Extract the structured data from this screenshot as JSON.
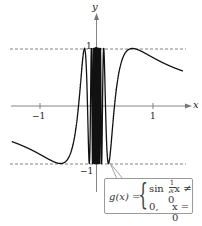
{
  "chart_data": {
    "type": "line",
    "title": "",
    "function_label": "g(x)",
    "definition": {
      "case1_expr": "sin 1/x",
      "case1_condition": "x ≠ 0",
      "case2_expr": "0,",
      "case2_condition": "x = 0"
    },
    "xlabel": "x",
    "ylabel": "y",
    "xlim": [
      -1.5,
      1.53
    ],
    "ylim": [
      -1,
      1
    ],
    "x_ticks": [
      -1,
      1
    ],
    "x_tick_labels": [
      "−1",
      "1"
    ],
    "y_tick_labels": [
      "1",
      "−1"
    ],
    "asymptote_lines": [
      {
        "y": 1,
        "style": "dashed"
      },
      {
        "y": -1,
        "style": "dashed"
      }
    ],
    "series": [
      {
        "name": "g(x) = sin(1/x)",
        "expression": "sin(1/x)",
        "x_start": -1.5,
        "x_end": 1.53
      }
    ],
    "grid": false,
    "legend": "none"
  },
  "labels": {
    "x_axis": "x",
    "y_axis": "y",
    "tick_neg1_x": "−1",
    "tick_pos1_x": "1",
    "tick_pos1_y": "1",
    "tick_neg1_y": "−1"
  },
  "formula": {
    "lhs": "g(x) =",
    "row1_func": "sin",
    "row1_frac_num": "1",
    "row1_frac_den": "x",
    "row1_cond": ", x ≠ 0",
    "row2_val": "0,",
    "row2_cond": "x = 0"
  },
  "colors": {
    "curve": "#111111",
    "axis": "#777777",
    "dashed": "#777777",
    "box_border": "#9a9a9a"
  }
}
